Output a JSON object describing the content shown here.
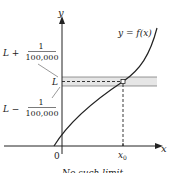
{
  "figure": {
    "axes": {
      "x_label": "x",
      "y_label": "y",
      "origin_label": "0"
    },
    "curve_label": "y = f(x)",
    "band": {
      "center_label": "L",
      "upper_label_prefix": "L +",
      "lower_label_prefix": "L −",
      "fraction_numerator": "1",
      "fraction_denominator": "100,000",
      "fill_color": "#e6e6e6"
    },
    "point_label": "x",
    "point_label_subscript": "0",
    "caption_partial": "No such limit"
  }
}
